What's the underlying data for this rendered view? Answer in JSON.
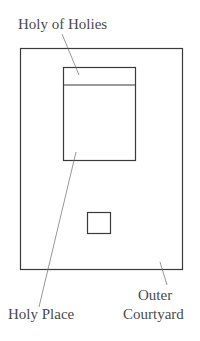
{
  "diagram": {
    "labels": {
      "holy_of_holies": "Holy of Holies",
      "holy_place": "Holy Place",
      "outer_line1": "Outer",
      "outer_line2": "Courtyard"
    },
    "colors": {
      "stroke": "#3a3a3a",
      "leader": "#6a6a6a",
      "text": "#4a4a4a"
    }
  }
}
